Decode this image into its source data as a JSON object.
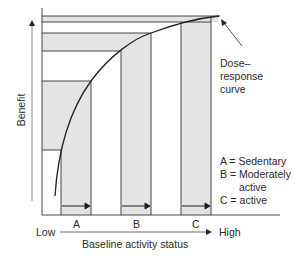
{
  "diagram": {
    "y_axis_label": "Benefit",
    "x_axis": {
      "low_label": "Low",
      "high_label": "High",
      "title": "Baseline activity status"
    },
    "bars": [
      {
        "id": "A",
        "label": "A"
      },
      {
        "id": "B",
        "label": "B"
      },
      {
        "id": "C",
        "label": "C"
      }
    ],
    "curve_label": [
      "Dose–",
      "response",
      "curve"
    ],
    "legend": [
      "A = Sedentary",
      "B = Moderately",
      "active",
      "C = active"
    ],
    "colors": {
      "shade": "#e4e4e4",
      "line": "#333333"
    }
  }
}
